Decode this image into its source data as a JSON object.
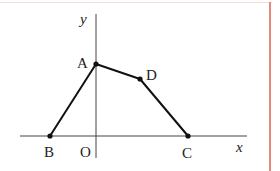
{
  "diagram": {
    "axes": {
      "x_label": "x",
      "y_label": "y",
      "origin_label": "O"
    },
    "points": [
      {
        "name": "A",
        "label": "A"
      },
      {
        "name": "B",
        "label": "B"
      },
      {
        "name": "C",
        "label": "C"
      },
      {
        "name": "D",
        "label": "D"
      }
    ],
    "polyline": [
      "B",
      "A",
      "D",
      "C"
    ],
    "colors": {
      "line": "#111111",
      "axis": "#444444",
      "frame": "#e8877a"
    }
  }
}
